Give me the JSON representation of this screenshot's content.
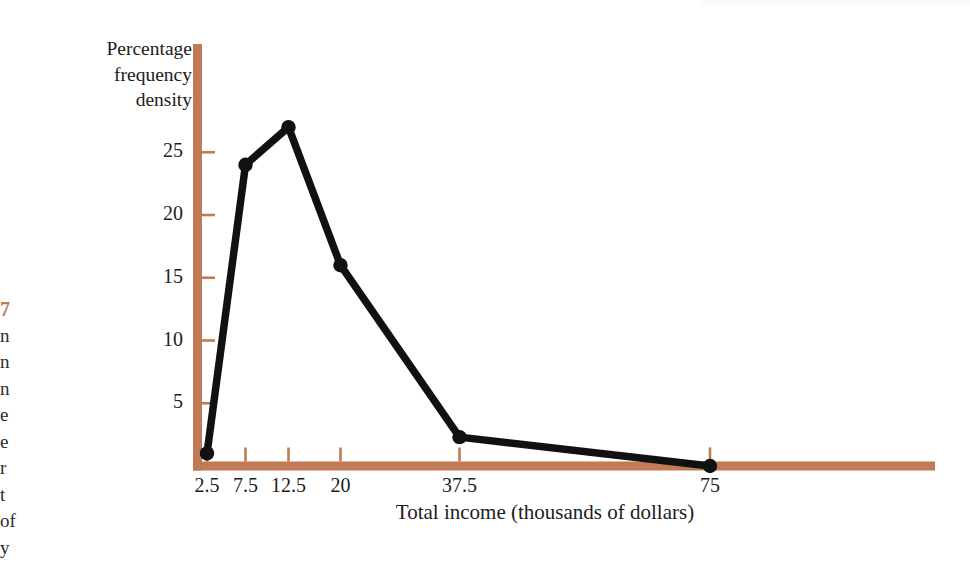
{
  "page": {
    "caption_fragment": {
      "number": "7",
      "lines": [
        "n",
        "n",
        "n",
        "e",
        "e",
        "r",
        "t",
        "of",
        "y"
      ]
    }
  },
  "chart_data": {
    "type": "line",
    "title": "",
    "subtitle": "",
    "xlabel": "Total income (thousands of dollars)",
    "ylabel": "Percentage frequency density",
    "ylabel_lines": [
      "Percentage",
      "frequency",
      "density"
    ],
    "categories": [
      "2.5",
      "7.5",
      "12.5",
      "20",
      "37.5",
      "75"
    ],
    "x": [
      2.5,
      7.5,
      12.5,
      20,
      37.5,
      75
    ],
    "values": [
      1,
      24,
      27,
      16,
      2.3,
      0
    ],
    "series": [
      {
        "name": "Percentage frequency density",
        "values": [
          1,
          24,
          27,
          16,
          2.3,
          0
        ]
      }
    ],
    "ytick_labels": [
      "5",
      "10",
      "15",
      "20",
      "25"
    ],
    "yticks": [
      5,
      10,
      15,
      20,
      25
    ],
    "xtick_labels": [
      "2.5",
      "7.5",
      "12.5",
      "20",
      "37.5",
      "75"
    ],
    "ylim": [
      0,
      29
    ],
    "grid": false,
    "legend": "none",
    "axis_color": "#c07b55",
    "line_color": "#111111",
    "marker": "circle"
  }
}
